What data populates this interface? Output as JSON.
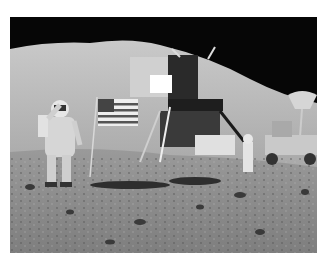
{
  "image": {
    "subject": "astronaut saluting beside flag with lunar module and lunar rover on the moon",
    "style": "grayscale photograph",
    "colors": {
      "sky": "#050505",
      "hill": "#b9b9b9",
      "ground": "#8a8a8a",
      "background": "#ffffff"
    }
  }
}
